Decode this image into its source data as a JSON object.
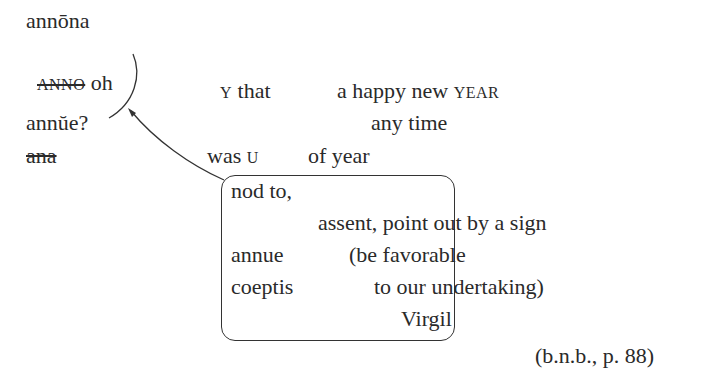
{
  "left_column": {
    "word1": "annōna",
    "word2_struck": "ANNO",
    "word2_tail": "oh",
    "word3": "annŭe?",
    "word4_struck": "ana"
  },
  "middle": {
    "line1_cap": "Y",
    "line1_rest": "that",
    "line1_b": "a happy new",
    "line1_cap2": "YEAR",
    "line2": "any time",
    "line3_a": "was",
    "line3_cap": "U",
    "line3_b": "of year"
  },
  "box": {
    "line1": "nod to,",
    "line2": "assent, point out by a sign",
    "line3_a": "annue",
    "line3_b": "(be favorable",
    "line4_a": "coeptis",
    "line4_b": "to our undertaking)",
    "line5": "Virgil"
  },
  "citation": "(b.n.b., p. 88)"
}
